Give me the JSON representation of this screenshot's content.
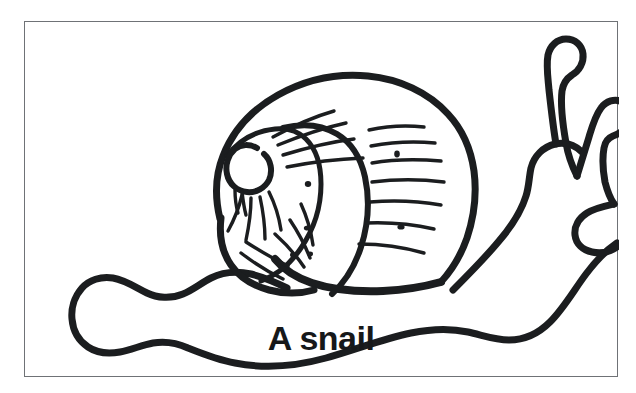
{
  "page": {
    "background_color": "#ffffff",
    "width": 636,
    "height": 393
  },
  "frame": {
    "border_color": "#6f7276",
    "background_color": "#ffffff",
    "border_width_px": 1
  },
  "illustration": {
    "name": "snail-line-drawing",
    "style": "black-and-white line art / coloring-book outline",
    "ink_color": "#1b1d1f",
    "fill_color": "#ffffff",
    "subject": "snail",
    "facing": "right",
    "parts": [
      "shell-spiral",
      "shell-growth-ridges",
      "body-foot",
      "head",
      "upper-tentacle-long",
      "upper-tentacle-short",
      "lower-lip"
    ]
  },
  "caption": {
    "text": "A snail",
    "color": "#16181a",
    "weight": "bold",
    "align": "center"
  }
}
